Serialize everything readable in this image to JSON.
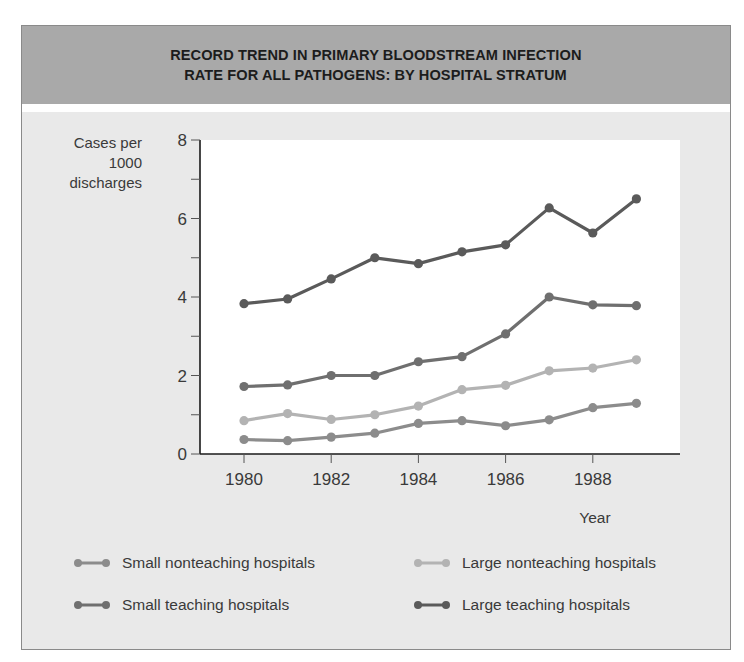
{
  "title": {
    "line1": "RECORD TREND IN PRIMARY BLOODSTREAM INFECTION",
    "line2": "RATE FOR ALL PATHOGENS: BY HOSPITAL STRATUM"
  },
  "axes": {
    "ylabel_lines": [
      "Cases per",
      "1000",
      "discharges"
    ],
    "xlabel": "Year",
    "yticks": [
      "0",
      "2",
      "4",
      "6",
      "8"
    ],
    "xticks": [
      "1980",
      "1982",
      "1984",
      "1986",
      "1988"
    ]
  },
  "legend": [
    {
      "label": "Small nonteaching hospitals",
      "color": "#8c8c8c"
    },
    {
      "label": "Large nonteaching hospitals",
      "color": "#b3b3b3"
    },
    {
      "label": "Small teaching hospitals",
      "color": "#6f6f6f"
    },
    {
      "label": "Large teaching hospitals",
      "color": "#5a5a5a"
    }
  ],
  "chart_data": {
    "type": "line",
    "title": "Record trend in primary bloodstream infection rate for all pathogens: by hospital stratum",
    "xlabel": "Year",
    "ylabel": "Cases per 1000 discharges",
    "x": [
      1980,
      1981,
      1982,
      1983,
      1984,
      1985,
      1986,
      1987,
      1988,
      1989
    ],
    "ylim": [
      0,
      8
    ],
    "xticks": [
      1980,
      1982,
      1984,
      1986,
      1988
    ],
    "yticks": [
      0,
      2,
      4,
      6,
      8
    ],
    "grid": false,
    "legend_position": "bottom",
    "series": [
      {
        "name": "Small nonteaching hospitals",
        "color": "#8c8c8c",
        "values": [
          0.37,
          0.34,
          0.43,
          0.53,
          0.78,
          0.85,
          0.72,
          0.87,
          1.18,
          1.29
        ]
      },
      {
        "name": "Large nonteaching hospitals",
        "color": "#b3b3b3",
        "values": [
          0.85,
          1.03,
          0.88,
          1.0,
          1.22,
          1.64,
          1.75,
          2.12,
          2.19,
          2.4
        ]
      },
      {
        "name": "Small teaching hospitals",
        "color": "#6f6f6f",
        "values": [
          1.72,
          1.76,
          2.0,
          2.0,
          2.35,
          2.48,
          3.06,
          4.0,
          3.8,
          3.78
        ]
      },
      {
        "name": "Large teaching hospitals",
        "color": "#5a5a5a",
        "values": [
          3.83,
          3.95,
          4.46,
          5.0,
          4.85,
          5.15,
          5.33,
          6.27,
          5.63,
          6.5
        ]
      }
    ]
  }
}
